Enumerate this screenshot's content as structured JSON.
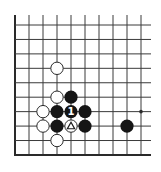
{
  "diagram": {
    "type": "go-board-fragment",
    "corner": "lower-left",
    "grid": {
      "columns": 10,
      "rows": 10,
      "x0": 15,
      "y0": 25,
      "spacing_x": 14,
      "spacing_y": 14.44,
      "line_top": 15,
      "line_right": 151,
      "line_color": "#3a3a3a",
      "edge_color": "#2a2a2a"
    },
    "star_points": [
      {
        "col": 9,
        "row": 6
      }
    ],
    "stones": [
      {
        "col": 3,
        "row": 3,
        "color": "white"
      },
      {
        "col": 3,
        "row": 5,
        "color": "white"
      },
      {
        "col": 4,
        "row": 5,
        "color": "black"
      },
      {
        "col": 2,
        "row": 6,
        "color": "white"
      },
      {
        "col": 3,
        "row": 6,
        "color": "black"
      },
      {
        "col": 4,
        "row": 6,
        "color": "black",
        "label": "1"
      },
      {
        "col": 5,
        "row": 6,
        "color": "black"
      },
      {
        "col": 2,
        "row": 7,
        "color": "white"
      },
      {
        "col": 3,
        "row": 7,
        "color": "black"
      },
      {
        "col": 4,
        "row": 7,
        "color": "white",
        "mark": "triangle"
      },
      {
        "col": 5,
        "row": 7,
        "color": "black"
      },
      {
        "col": 8,
        "row": 7,
        "color": "black"
      },
      {
        "col": 3,
        "row": 8,
        "color": "white"
      }
    ],
    "colors": {
      "black_stone": "#151515",
      "white_stone": "#ffffff",
      "white_stone_outline": "#2a2a2a",
      "label_on_black": "#ffffff",
      "mark_on_white": "#1a1a1a"
    }
  }
}
